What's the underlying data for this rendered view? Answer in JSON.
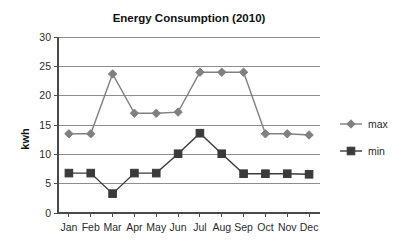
{
  "chart_data": {
    "type": "line",
    "title": "Energy Consumption (2010)",
    "xlabel": "",
    "ylabel": "kwh",
    "categories": [
      "Jan",
      "Feb",
      "Mar",
      "Apr",
      "May",
      "Jun",
      "Jul",
      "Aug",
      "Sep",
      "Oct",
      "Nov",
      "Dec"
    ],
    "series": [
      {
        "name": "max",
        "color": "#808080",
        "marker": "diamond",
        "values": [
          13.5,
          13.5,
          23.7,
          17.0,
          17.0,
          17.2,
          24.0,
          24.0,
          24.0,
          13.5,
          13.5,
          13.3
        ]
      },
      {
        "name": "min",
        "color": "#3a3a3a",
        "marker": "square",
        "values": [
          6.8,
          6.8,
          3.3,
          6.8,
          6.8,
          10.1,
          13.6,
          10.1,
          6.7,
          6.7,
          6.7,
          6.6
        ]
      }
    ],
    "ylim": [
      0,
      30
    ],
    "yticks": [
      0,
      5,
      10,
      15,
      20,
      25,
      30
    ],
    "ytick_labels": [
      "0",
      "5",
      "10",
      "15",
      "20",
      "25",
      "30"
    ],
    "grid": true,
    "grid_axis": "y",
    "legend_position": "right",
    "legend": [
      "max",
      "min"
    ]
  }
}
